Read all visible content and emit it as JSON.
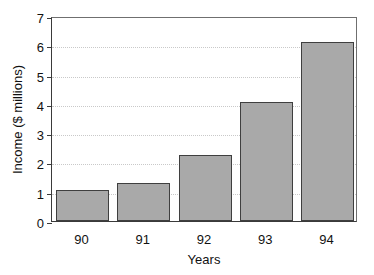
{
  "chart_data": {
    "type": "bar",
    "title": "",
    "xlabel": "Years",
    "ylabel": "Income ($ millions)",
    "categories": [
      "90",
      "91",
      "92",
      "93",
      "94"
    ],
    "values": [
      1.05,
      1.3,
      2.25,
      4.05,
      6.1
    ],
    "ylim": [
      0,
      7
    ],
    "ytick_labels": [
      "0",
      "1",
      "2",
      "3",
      "4",
      "5",
      "6",
      "7"
    ],
    "ytick_values": [
      0,
      1,
      2,
      3,
      4,
      5,
      6,
      7
    ],
    "gridlines_at": [
      1,
      2,
      3,
      4,
      5,
      6
    ],
    "grid": "horizontal-dotted",
    "legend": "none",
    "bar_fill_color": "#a9a9a9",
    "bar_border_color": "#3f3f3f",
    "grid_color": "#c9c9c9",
    "axis_color": "#3a3a3a",
    "background_color": "#ffffff"
  }
}
